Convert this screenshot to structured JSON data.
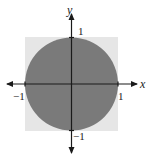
{
  "diagram": {
    "type": "unit-circle-in-square",
    "axes": {
      "x_label": "x",
      "y_label": "y"
    },
    "ticks": {
      "x_pos": "1",
      "x_neg": "−1",
      "y_pos": "1",
      "y_neg": "−1"
    },
    "shapes": {
      "square": {
        "from": [
          -1,
          -1
        ],
        "to": [
          1,
          1
        ],
        "fill": "#e6e6e6"
      },
      "circle": {
        "center": [
          0,
          0
        ],
        "radius": 1,
        "fill": "#7a7a7a"
      }
    },
    "colors": {
      "axis": "#1a1a1a",
      "square_fill": "#e6e6e6",
      "circle_fill": "#7a7a7a",
      "background": "#ffffff"
    }
  }
}
